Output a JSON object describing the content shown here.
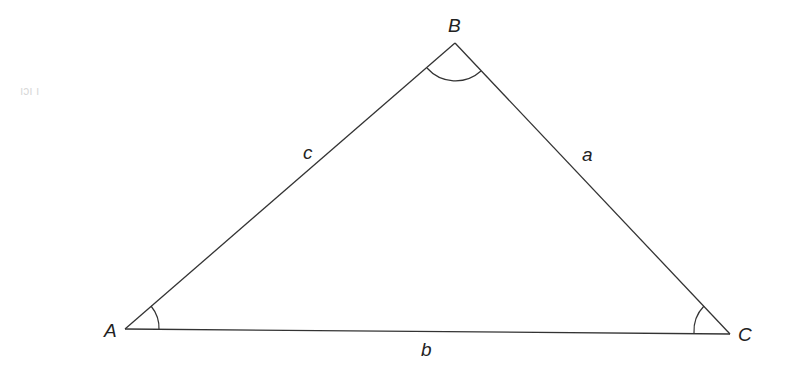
{
  "diagram": {
    "type": "triangle",
    "vertices": [
      {
        "id": "A",
        "label": "A",
        "x": 125,
        "y": 329
      },
      {
        "id": "B",
        "label": "B",
        "x": 455,
        "y": 43
      },
      {
        "id": "C",
        "label": "C",
        "x": 730,
        "y": 334
      }
    ],
    "sides": [
      {
        "id": "c",
        "label": "c",
        "from": "A",
        "to": "B"
      },
      {
        "id": "a",
        "label": "a",
        "from": "B",
        "to": "C"
      },
      {
        "id": "b",
        "label": "b",
        "from": "A",
        "to": "C"
      }
    ],
    "angle_marks": [
      "A",
      "B",
      "C"
    ],
    "faint_margin_text": "ıɔı ı"
  }
}
